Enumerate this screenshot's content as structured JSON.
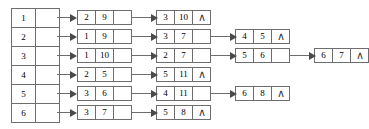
{
  "diagram": {
    "nil_glyph": "∧",
    "colors": {
      "stroke": "#6d6d6d",
      "text": "#000000",
      "background": "#ffffff",
      "arrow_head": "#4a4a4a"
    },
    "vertex_table": {
      "rows": [
        {
          "index": "1"
        },
        {
          "index": "2"
        },
        {
          "index": "3"
        },
        {
          "index": "4"
        },
        {
          "index": "5"
        },
        {
          "index": "6"
        }
      ]
    },
    "chains": [
      {
        "vertex": "1",
        "nodes": [
          {
            "vertex": "2",
            "weight": "9",
            "terminal": false
          },
          {
            "vertex": "3",
            "weight": "10",
            "terminal": true
          }
        ]
      },
      {
        "vertex": "2",
        "nodes": [
          {
            "vertex": "1",
            "weight": "9",
            "terminal": false
          },
          {
            "vertex": "3",
            "weight": "7",
            "terminal": false
          },
          {
            "vertex": "4",
            "weight": "5",
            "terminal": true
          }
        ]
      },
      {
        "vertex": "3",
        "nodes": [
          {
            "vertex": "1",
            "weight": "10",
            "terminal": false
          },
          {
            "vertex": "2",
            "weight": "7",
            "terminal": false
          },
          {
            "vertex": "5",
            "weight": "6",
            "terminal": false
          },
          {
            "vertex": "6",
            "weight": "7",
            "terminal": true
          }
        ]
      },
      {
        "vertex": "4",
        "nodes": [
          {
            "vertex": "2",
            "weight": "5",
            "terminal": false
          },
          {
            "vertex": "5",
            "weight": "11",
            "terminal": true
          }
        ]
      },
      {
        "vertex": "5",
        "nodes": [
          {
            "vertex": "3",
            "weight": "6",
            "terminal": false
          },
          {
            "vertex": "4",
            "weight": "11",
            "terminal": false
          },
          {
            "vertex": "6",
            "weight": "8",
            "terminal": true
          }
        ]
      },
      {
        "vertex": "6",
        "nodes": [
          {
            "vertex": "3",
            "weight": "7",
            "terminal": false
          },
          {
            "vertex": "5",
            "weight": "8",
            "terminal": true
          }
        ]
      }
    ]
  }
}
